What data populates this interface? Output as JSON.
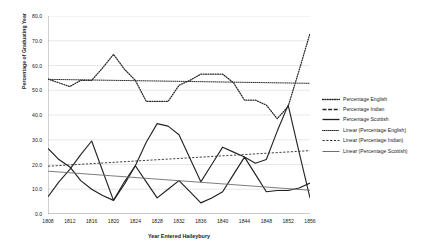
{
  "chart_data": {
    "type": "line",
    "title": "",
    "xlabel": "Year Entered Haileybury",
    "ylabel": "Percentage of Graduating Year",
    "xlim": [
      1808,
      1856
    ],
    "ylim": [
      0.0,
      80.0
    ],
    "grid": "horizontal",
    "legend_position": "right",
    "ytick_labels": [
      "80.0",
      "70.0",
      "60.0",
      "50.0",
      "40.0",
      "30.0",
      "20.0",
      "10.0",
      "0.0"
    ],
    "ytick_values": [
      80.0,
      70.0,
      60.0,
      50.0,
      40.0,
      30.0,
      20.0,
      10.0,
      0.0
    ],
    "xtick_labels": [
      "1808",
      "1812",
      "1816",
      "1820",
      "1824",
      "1828",
      "1832",
      "1836",
      "1840",
      "1844",
      "1848",
      "1852",
      "1856"
    ],
    "xtick_values": [
      1808,
      1812,
      1816,
      1820,
      1824,
      1828,
      1832,
      1836,
      1840,
      1844,
      1848,
      1852,
      1856
    ],
    "x": [
      1808,
      1810,
      1812,
      1814,
      1816,
      1818,
      1820,
      1822,
      1824,
      1826,
      1828,
      1830,
      1832,
      1834,
      1836,
      1838,
      1840,
      1842,
      1844,
      1846,
      1848,
      1850,
      1852,
      1854,
      1856
    ],
    "series": [
      {
        "name": "Percentage English",
        "style": "dotted",
        "color": "#262626",
        "values": [
          54.5,
          53.0,
          51.5,
          54.0,
          54.0,
          59.0,
          64.5,
          58.5,
          54.0,
          45.5,
          45.5,
          45.5,
          52.0,
          54.0,
          56.5,
          56.5,
          56.5,
          53.0,
          46.0,
          46.0,
          44.0,
          38.5,
          43.5,
          58.0,
          73.0
        ]
      },
      {
        "name": "Percentage Indian",
        "style": "long-dash",
        "color": "#262626",
        "values": [
          7.0,
          13.0,
          18.0,
          24.0,
          29.5,
          17.5,
          5.5,
          13.0,
          19.5,
          29.0,
          36.5,
          35.5,
          32.0,
          22.5,
          13.0,
          20.0,
          27.0,
          25.0,
          23.0,
          20.5,
          22.0,
          33.5,
          44.0,
          25.0,
          6.5
        ]
      },
      {
        "name": "Percentage Scottish",
        "style": "solid",
        "color": "#1f1f1f",
        "values": [
          26.5,
          22.0,
          19.0,
          13.5,
          10.0,
          7.5,
          5.5,
          12.0,
          19.5,
          13.0,
          6.5,
          10.0,
          13.5,
          9.0,
          4.5,
          6.5,
          9.0,
          16.0,
          23.0,
          16.0,
          9.0,
          9.5,
          9.5,
          10.5,
          12.5
        ]
      }
    ],
    "trendlines": [
      {
        "name": "Linear (Percentage English)",
        "style": "fine-dotted",
        "color": "#262626",
        "start": [
          1808,
          54.4
        ],
        "end": [
          1856,
          52.8
        ]
      },
      {
        "name": "Linear (Percentage Indian)",
        "style": "short-dash",
        "color": "#2e2e2e",
        "start": [
          1808,
          19.3
        ],
        "end": [
          1856,
          25.6
        ]
      },
      {
        "name": "Linear (Percentage Scottish)",
        "style": "solid-thin",
        "color": "#6e6e6e",
        "start": [
          1808,
          17.3
        ],
        "end": [
          1856,
          9.6
        ]
      }
    ]
  },
  "legend": {
    "items": [
      {
        "label": "Percentage English"
      },
      {
        "label": "Percentage Indian"
      },
      {
        "label": "Percentage Scottish"
      },
      {
        "label": "Linear (Percentage English)"
      },
      {
        "label": "Linear (Percentage Indian)"
      },
      {
        "label": "Linear (Percentage Scottish)"
      }
    ]
  }
}
